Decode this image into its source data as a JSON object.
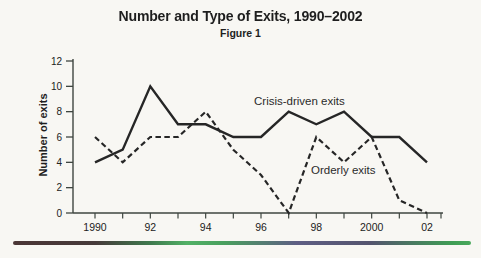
{
  "page": {
    "background": "#f8f7f3",
    "ink": "#262626",
    "axis_color": "#3f4640"
  },
  "header": {
    "title": "Number and Type of Exits, 1990–2002",
    "figure_label": "Figure 1"
  },
  "chart_data": {
    "type": "line",
    "title": "Number and Type of Exits, 1990–2002",
    "subtitle": "Figure 1",
    "xlabel": "",
    "ylabel": "Number of exits",
    "ylim": [
      0,
      12
    ],
    "yticks": [
      0,
      2,
      4,
      6,
      8,
      10,
      12
    ],
    "x": [
      1990,
      1991,
      1992,
      1993,
      1994,
      1995,
      1996,
      1997,
      1998,
      1999,
      2000,
      2001,
      2002
    ],
    "xticks": [
      {
        "x": 1990,
        "label": "1990"
      },
      {
        "x": 1992,
        "label": "92"
      },
      {
        "x": 1994,
        "label": "94"
      },
      {
        "x": 1996,
        "label": "96"
      },
      {
        "x": 1998,
        "label": "98"
      },
      {
        "x": 2000,
        "label": "2000"
      },
      {
        "x": 2002,
        "label": "02"
      }
    ],
    "grid": false,
    "legend_position": "inline-annotations",
    "line_color": "#262626",
    "series": [
      {
        "name": "Crisis-driven exits",
        "line_style": "solid",
        "values": [
          4,
          5,
          10,
          7,
          7,
          6,
          6,
          8,
          7,
          8,
          6,
          6,
          4
        ]
      },
      {
        "name": "Orderly exits",
        "line_style": "dashed",
        "values": [
          6,
          4,
          6,
          6,
          8,
          5,
          3,
          0,
          6,
          4,
          6,
          1,
          0
        ]
      }
    ]
  }
}
